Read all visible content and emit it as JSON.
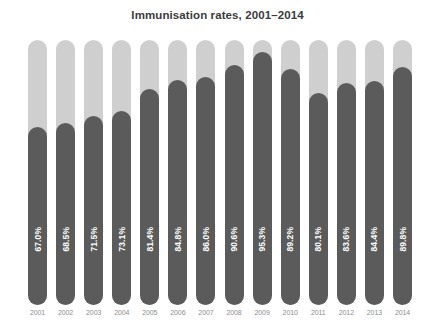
{
  "chart_data": {
    "type": "bar",
    "title": "Immunisation rates, 2001–2014",
    "xlabel": "",
    "ylabel": "",
    "ylim": [
      0,
      100
    ],
    "grid": false,
    "legend": null,
    "orientation": "vertical",
    "categories": [
      "2001",
      "2002",
      "2003",
      "2004",
      "2005",
      "2006",
      "2007",
      "2008",
      "2009",
      "2010",
      "2011",
      "2012",
      "2013",
      "2014"
    ],
    "values": [
      67.0,
      68.5,
      71.5,
      73.1,
      81.4,
      84.8,
      86.0,
      90.6,
      95.3,
      89.2,
      80.1,
      83.6,
      84.4,
      89.8
    ],
    "data_labels": [
      "67.0%",
      "68.5%",
      "71.5%",
      "73.1%",
      "81.4%",
      "84.8%",
      "86.0%",
      "90.6%",
      "95.3%",
      "89.2%",
      "80.1%",
      "83.6%",
      "84.4%",
      "89.8%"
    ],
    "colors": {
      "fill": "#5b5b5b",
      "track": "#cfcfcf",
      "background": "#ffffff",
      "title_text": "#3b3b3b",
      "value_text": "#ffffff",
      "tick_text": "#8d8d8d"
    }
  }
}
